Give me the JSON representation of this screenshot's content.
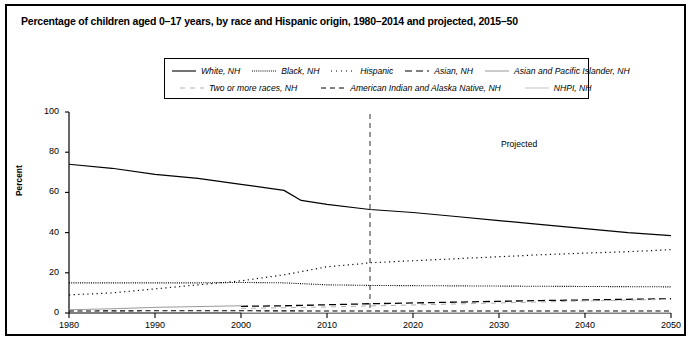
{
  "chart_title": "Percentage of children aged 0–17 years, by race and Hispanic origin, 1980–2014 and projected, 2015–50",
  "annotations": {
    "projected": "Projected",
    "projection_start_year": 2015
  },
  "legend": {
    "rows": [
      [
        {
          "label": "White, NH",
          "style": "solid",
          "key": "white_nh"
        },
        {
          "label": "Black, NH",
          "style": "dotted-fine",
          "key": "black_nh"
        },
        {
          "label": "Hispanic",
          "style": "dotted-sparse",
          "key": "hispanic"
        },
        {
          "label": "Asian, NH",
          "style": "dashed-long",
          "key": "asian_nh"
        },
        {
          "label": "Asian and Pacific Islander, NH",
          "style": "solid-light",
          "key": "api_nh"
        }
      ],
      [
        {
          "label": "Two or more races, NH",
          "style": "dashed-light",
          "key": "two_or_more_nh"
        },
        {
          "label": "American Indian and Alaska Native, NH",
          "style": "dashed-medium",
          "key": "aian_nh"
        },
        {
          "label": "NHPI, NH",
          "style": "solid-vlight",
          "key": "nhpi_nh"
        }
      ]
    ]
  },
  "chart_data": {
    "type": "line",
    "title": "Percentage of children aged 0–17 years, by race and Hispanic origin, 1980–2014 and projected, 2015–50",
    "xlabel": "",
    "ylabel": "Percent",
    "xlim": [
      1980,
      2050
    ],
    "ylim": [
      0,
      100
    ],
    "grid": false,
    "legend_position": "top-center",
    "xticks": [
      1980,
      1990,
      2000,
      2010,
      2020,
      2030,
      2040,
      2050
    ],
    "yticks": [
      0,
      20,
      40,
      60,
      80,
      100
    ],
    "series": [
      {
        "name": "White, NH",
        "style": "solid",
        "x": [
          1980,
          1985,
          1990,
          1995,
          2000,
          2005,
          2007,
          2010,
          2014,
          2015,
          2020,
          2025,
          2030,
          2035,
          2040,
          2045,
          2050
        ],
        "values": [
          74,
          72,
          69,
          67,
          64,
          61,
          56,
          54,
          52,
          51.5,
          50,
          48,
          46,
          44,
          42,
          40,
          38.5
        ]
      },
      {
        "name": "Black, NH",
        "style": "dotted-fine",
        "x": [
          1980,
          1985,
          1990,
          1995,
          2000,
          2005,
          2010,
          2014,
          2015,
          2020,
          2025,
          2030,
          2035,
          2040,
          2045,
          2050
        ],
        "values": [
          15,
          15,
          15,
          15,
          15.2,
          15,
          14,
          13.8,
          13.7,
          13.6,
          13.5,
          13.4,
          13.3,
          13.2,
          13.1,
          13
        ]
      },
      {
        "name": "Hispanic",
        "style": "dotted-sparse",
        "x": [
          1980,
          1985,
          1990,
          1995,
          2000,
          2005,
          2010,
          2014,
          2015,
          2020,
          2025,
          2030,
          2035,
          2040,
          2045,
          2050
        ],
        "values": [
          9,
          10,
          12,
          14,
          16,
          19,
          23,
          24.5,
          25,
          26,
          27,
          28,
          29,
          29.8,
          30.5,
          31.5
        ]
      },
      {
        "name": "Asian, NH",
        "style": "dashed-long",
        "x": [
          2000,
          2005,
          2010,
          2014,
          2015,
          2020,
          2025,
          2030,
          2035,
          2040,
          2045,
          2050
        ],
        "values": [
          3.3,
          3.6,
          4.1,
          4.5,
          4.6,
          5.0,
          5.4,
          5.8,
          6.2,
          6.5,
          6.8,
          7.1
        ]
      },
      {
        "name": "Asian and Pacific Islander, NH",
        "style": "solid-light",
        "x": [
          1980,
          1985,
          1990,
          1995,
          2000
        ],
        "values": [
          1.6,
          2.1,
          2.8,
          3.2,
          3.6
        ]
      },
      {
        "name": "Two or more races, NH",
        "style": "dashed-light",
        "x": [
          2000,
          2005,
          2010,
          2014,
          2015,
          2020,
          2025,
          2030,
          2035,
          2040,
          2045,
          2050
        ],
        "values": [
          2.3,
          2.6,
          3.0,
          3.4,
          3.5,
          4.0,
          4.5,
          5.0,
          5.5,
          6.0,
          6.4,
          6.8
        ]
      },
      {
        "name": "American Indian and Alaska Native, NH",
        "style": "dashed-medium",
        "x": [
          1980,
          1990,
          2000,
          2010,
          2015,
          2020,
          2030,
          2040,
          2050
        ],
        "values": [
          1.0,
          1.1,
          1.1,
          1.0,
          1.0,
          1.0,
          1.0,
          1.0,
          1.0
        ]
      },
      {
        "name": "NHPI, NH",
        "style": "solid-vlight",
        "x": [
          2000,
          2010,
          2015,
          2020,
          2030,
          2040,
          2050
        ],
        "values": [
          0.2,
          0.2,
          0.2,
          0.2,
          0.2,
          0.3,
          0.3
        ]
      }
    ]
  }
}
